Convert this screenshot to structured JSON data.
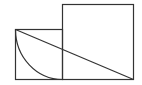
{
  "diagram": {
    "type": "geometry",
    "stroke_color": "#333333",
    "background": "#ffffff",
    "small_square": {
      "x": 15,
      "y": 29,
      "w": 47,
      "h": 50
    },
    "large_square": {
      "x": 62,
      "y": 4,
      "w": 71,
      "h": 75
    },
    "diagonal": {
      "x1": 15,
      "y1": 29,
      "x2": 133,
      "y2": 79
    },
    "arc": {
      "start": [
        15,
        29
      ],
      "end": [
        62,
        79
      ],
      "rx": 47,
      "ry": 50
    }
  }
}
